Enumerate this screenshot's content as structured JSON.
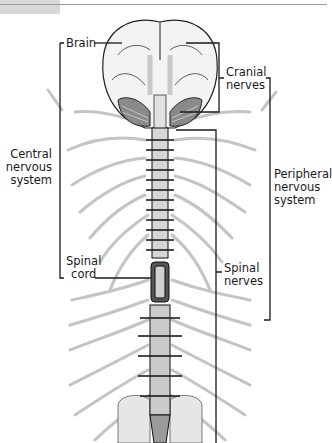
{
  "diagram": {
    "type": "anatomy",
    "labels": {
      "brain": "Brain",
      "cranial_nerves": [
        "Cranial",
        "nerves"
      ],
      "central_nervous_system": [
        "Central",
        "nervous",
        "system"
      ],
      "peripheral_nervous_system": [
        "Peripheral",
        "nervous",
        "system"
      ],
      "spinal_cord": [
        "Spinal",
        "cord"
      ],
      "spinal_nerves": [
        "Spinal",
        "nerves"
      ]
    },
    "groupings": [
      {
        "bracket": "Central nervous system",
        "includes": [
          "Brain",
          "Spinal cord"
        ]
      },
      {
        "bracket": "Peripheral nervous system",
        "includes": [
          "Cranial nerves",
          "Spinal nerves"
        ]
      }
    ],
    "colors": {
      "line": "#1a1a1a",
      "nerves": "#bdbdbd",
      "brain_fill": "#f2f2f2",
      "header_tab": "#d8d8d8"
    }
  }
}
